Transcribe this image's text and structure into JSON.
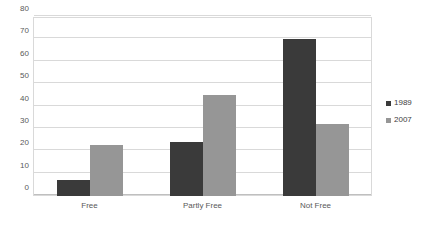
{
  "chart_data": {
    "type": "bar",
    "title": "",
    "subtitle": "",
    "xlabel": "",
    "ylabel": "",
    "categories": [
      "Free",
      "Partly Free",
      "Not Free"
    ],
    "series": [
      {
        "name": "1989",
        "color": "#3a3a3a",
        "values": [
          7,
          24,
          70
        ]
      },
      {
        "name": "2007",
        "color": "#969696",
        "values": [
          23,
          45,
          32
        ]
      }
    ],
    "ylim": [
      0,
      80
    ],
    "ytick_labels": [
      "0",
      "10",
      "20",
      "30",
      "40",
      "50",
      "60",
      "70",
      "80"
    ],
    "ytick_values": [
      0,
      10,
      20,
      30,
      40,
      50,
      60,
      70,
      80
    ],
    "grid": "horizontal",
    "legend_position": "right",
    "legend_entries": [
      "1989",
      "2007"
    ],
    "plot_background": "#ffffff",
    "gridline_color": "#d9d9d9"
  }
}
